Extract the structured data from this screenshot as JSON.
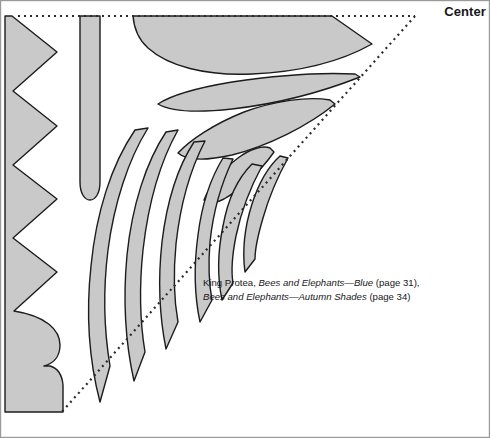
{
  "page": {
    "width": 490,
    "height": 438,
    "background_color": "#ffffff",
    "border_color": "#9a9a9a"
  },
  "labels": {
    "center": "Center"
  },
  "caption": {
    "line1_plain_a": "King Protea, ",
    "line1_italic": "Bees and Elephants—Blue",
    "line1_plain_b": " (page 31),",
    "line2_italic": "Bees and Elephants—Autumn Shades",
    "line2_plain": " (page 34)",
    "full_text": "King Protea, Bees and Elephants—Blue (page 31), Bees and Elephants—Autumn Shades (page 34)"
  },
  "style": {
    "shape_fill": "#c9c9c9",
    "shape_stroke": "#1c1c1c",
    "shape_stroke_width": 1.4,
    "dotted_color": "#2b2b2b",
    "dotted_width": 2,
    "dot_dash": "2 4"
  },
  "guides": {
    "top_dotted_label": "top-center-guide",
    "diagonal_dotted_label": "diagonal-fold-guide",
    "top_dotted_from": [
      18,
      16
    ],
    "top_dotted_to": [
      415,
      16
    ],
    "diagonal_from": [
      415,
      16
    ],
    "diagonal_to": [
      60,
      414
    ]
  },
  "shapes": [
    {
      "name": "sawtooth-border-strip",
      "teeth": 6,
      "fill": "#c9c9c9"
    },
    {
      "name": "vertical-stem-bar",
      "fill": "#c9c9c9"
    },
    {
      "name": "top-large-petal",
      "fill": "#c9c9c9"
    },
    {
      "name": "upper-pointed-leaf",
      "fill": "#c9c9c9"
    },
    {
      "name": "mid-pointed-leaf",
      "fill": "#c9c9c9"
    },
    {
      "name": "small-inner-leaf",
      "fill": "#c9c9c9"
    },
    {
      "name": "fan-petal-1",
      "fill": "#c9c9c9"
    },
    {
      "name": "fan-petal-2",
      "fill": "#c9c9c9"
    },
    {
      "name": "fan-petal-3",
      "fill": "#c9c9c9"
    },
    {
      "name": "fan-petal-4",
      "fill": "#c9c9c9"
    },
    {
      "name": "fan-petal-5",
      "fill": "#c9c9c9"
    },
    {
      "name": "fan-petal-6",
      "fill": "#c9c9c9"
    }
  ]
}
